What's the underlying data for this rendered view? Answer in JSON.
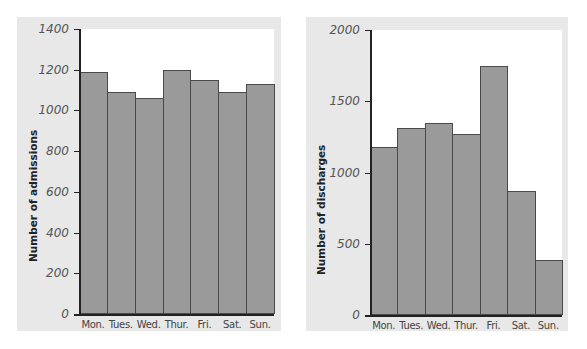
{
  "chart_data": [
    {
      "type": "bar",
      "title": "",
      "categories": [
        "Mon.",
        "Tues.",
        "Wed.",
        "Thur.",
        "Fri.",
        "Sat.",
        "Sun."
      ],
      "values": [
        1190,
        1090,
        1060,
        1200,
        1150,
        1090,
        1130
      ],
      "xlabel": "",
      "ylabel": "Number of admissions",
      "ylim": [
        0,
        1400
      ],
      "yticks": [
        0,
        200,
        400,
        600,
        800,
        1000,
        1200,
        1400
      ],
      "grid": false,
      "legend": null,
      "bar_color": "#9a9a9a"
    },
    {
      "type": "bar",
      "title": "",
      "categories": [
        "Mon.",
        "Tues.",
        "Wed.",
        "Thur.",
        "Fri.",
        "Sat.",
        "Sun."
      ],
      "values": [
        1180,
        1310,
        1350,
        1270,
        1750,
        870,
        385
      ],
      "xlabel": "",
      "ylabel": "Number of discharges",
      "ylim": [
        0,
        2000
      ],
      "yticks": [
        0,
        500,
        1000,
        1500,
        2000
      ],
      "grid": false,
      "legend": null,
      "bar_color": "#9a9a9a"
    }
  ],
  "colors": {
    "panel_bg": "#e8e8e8",
    "plot_bg": "#ffffff",
    "bar_fill": "#9a9a9a",
    "bar_edge": "#4a4a4a",
    "axis": "#222222"
  }
}
